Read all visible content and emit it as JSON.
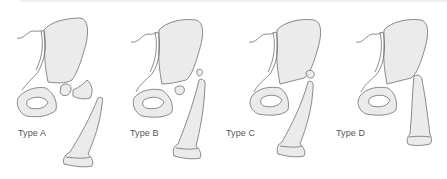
{
  "figure": {
    "panels": [
      {
        "id": "A",
        "label": "Type A",
        "left": 0
      },
      {
        "id": "B",
        "label": "Type B",
        "left": 112
      },
      {
        "id": "C",
        "label": "Type C",
        "left": 224
      },
      {
        "id": "D",
        "label": "Type D",
        "left": 336
      }
    ]
  },
  "colors": {
    "bone_fill": "#ebebeb",
    "outline": "#6e6e6e",
    "label_text": "#555555",
    "background": "#ffffff"
  }
}
